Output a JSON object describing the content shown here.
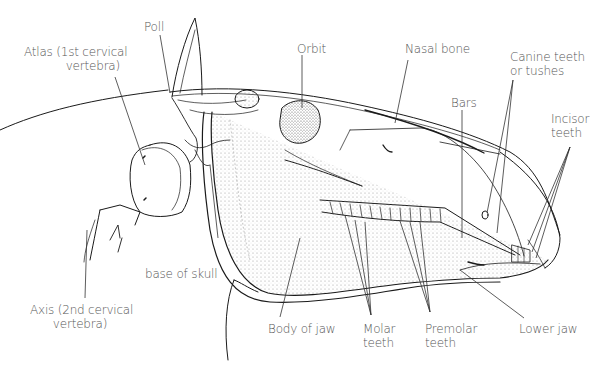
{
  "diagram": {
    "colors": {
      "line": "#1a1a1a",
      "label": "#555555",
      "background": "#ffffff",
      "shade": "#8a8a8a"
    },
    "labels": {
      "poll": "Poll",
      "atlas": "Atlas (1st cervical\nvertebra)",
      "orbit": "Orbit",
      "nasal_bone": "Nasal bone",
      "canine_teeth": "Canine teeth\nor tushes",
      "bars": "Bars",
      "incisor_teeth": "Incisor\nteeth",
      "base_of_skull": "base of skull",
      "axis": "Axis (2nd cervical\nvertebra)",
      "body_of_jaw": "Body of jaw",
      "molar_teeth": "Molar\nteeth",
      "premolar_teeth": "Premolar\nteeth",
      "lower_jaw": "Lower jaw"
    }
  }
}
